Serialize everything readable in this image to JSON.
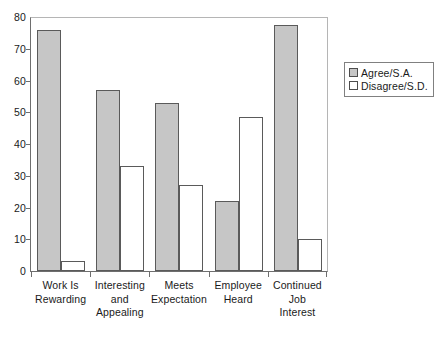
{
  "chart_data": {
    "type": "bar",
    "title": "",
    "subtitle": "",
    "xlabel": "",
    "ylabel": "",
    "ylim": [
      0,
      80
    ],
    "yticks": [
      0,
      10,
      20,
      30,
      40,
      50,
      60,
      70,
      80
    ],
    "grid": false,
    "legend_position": "right",
    "categories": [
      "Work Is Rewarding",
      "Interesting and Appealing",
      "Meets Expectation",
      "Employee Heard",
      "Continued Job Interest"
    ],
    "category_lines": [
      [
        "Work Is",
        "Rewarding"
      ],
      [
        "Interesting",
        "and",
        "Appealing"
      ],
      [
        "Meets",
        "Expectation"
      ],
      [
        "Employee",
        "Heard"
      ],
      [
        "Continued",
        "Job",
        "Interest"
      ]
    ],
    "series": [
      {
        "name": "Agree/S.A.",
        "color": "#c6c6c6",
        "values": [
          76,
          57,
          53,
          22,
          77.5
        ]
      },
      {
        "name": "Disagree/S.D.",
        "color": "#ffffff",
        "values": [
          3,
          33,
          27,
          48.5,
          10
        ]
      }
    ]
  },
  "legend": {
    "entries": [
      {
        "label": "Agree/S.A."
      },
      {
        "label": "Disagree/S.D."
      }
    ]
  }
}
